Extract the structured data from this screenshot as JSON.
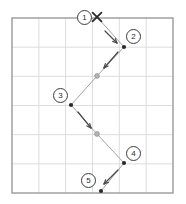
{
  "diagram": {
    "canvas": {
      "width": 186,
      "height": 204
    },
    "grid": {
      "x": 12,
      "y": 18,
      "width": 161,
      "height": 175,
      "columns": 6,
      "rows": 6,
      "border_color": "#9a9a9a",
      "line_color": "#d9d9d9",
      "fill_color": "#ffffff",
      "show_grid": true
    },
    "start_marker": {
      "name": "x-marker",
      "symbol": "×",
      "x": 97,
      "y": 17,
      "color": "#2b2b2b"
    },
    "path": {
      "stroke_color": "#9a9a9a",
      "stroke_width": 0.9,
      "points": [
        {
          "x": 97,
          "y": 17,
          "kind": "start",
          "label": "1"
        },
        {
          "x": 124,
          "y": 47,
          "kind": "node",
          "label": "2"
        },
        {
          "x": 97,
          "y": 76,
          "kind": "waypoint",
          "label": ""
        },
        {
          "x": 71,
          "y": 105,
          "kind": "node",
          "label": "3"
        },
        {
          "x": 97,
          "y": 134,
          "kind": "waypoint",
          "label": ""
        },
        {
          "x": 124,
          "y": 163,
          "kind": "node",
          "label": "4"
        },
        {
          "x": 101,
          "y": 191,
          "kind": "end",
          "label": "5"
        }
      ]
    },
    "node_dot": {
      "fill_color": "#2b2b2b",
      "radius": 2.1
    },
    "waypoint_dot": {
      "fill_color": "#b4b4b4",
      "stroke_color": "#8c8c8c",
      "radius": 2.4
    },
    "direction_arrows": [
      {
        "name": "arrow-1-to-2",
        "x1": 105,
        "y1": 31,
        "x2": 117,
        "y2": 43,
        "color": "#4a4a4a"
      },
      {
        "name": "arrow-2-to-3",
        "x1": 118,
        "y1": 52,
        "x2": 104,
        "y2": 68,
        "color": "#4a4a4a"
      },
      {
        "name": "arrow-3-to-4",
        "x1": 78,
        "y1": 112,
        "x2": 91,
        "y2": 128,
        "color": "#4a4a4a"
      },
      {
        "name": "arrow-4-to-5",
        "x1": 118,
        "y1": 170,
        "x2": 104,
        "y2": 184,
        "color": "#4a4a4a"
      }
    ],
    "labels": [
      {
        "name": "step-label-1",
        "text": "1",
        "x": 77,
        "y": 10
      },
      {
        "name": "step-label-2",
        "text": "2",
        "x": 126,
        "y": 29
      },
      {
        "name": "step-label-3",
        "text": "3",
        "x": 53,
        "y": 88
      },
      {
        "name": "step-label-4",
        "text": "4",
        "x": 126,
        "y": 146
      },
      {
        "name": "step-label-5",
        "text": "5",
        "x": 81,
        "y": 173
      }
    ]
  }
}
